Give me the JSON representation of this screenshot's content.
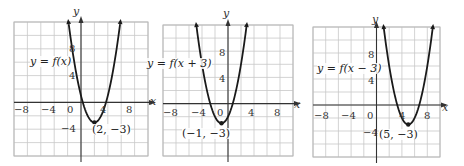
{
  "chart_data": [
    {
      "type": "line",
      "title": "",
      "function_label": "y = f(x)",
      "equation": "y = (x - 2)^2 - 3",
      "vertex": [
        2,
        -3
      ],
      "vertex_label": "(2, −3)",
      "xlabel": "x",
      "ylabel": "y",
      "xlim": [
        -10,
        10
      ],
      "ylim": [
        -8,
        12
      ],
      "x_ticks": [
        -8,
        -4,
        0,
        4,
        8
      ],
      "y_ticks": [
        8,
        4,
        -4
      ],
      "grid": true,
      "grid_step": 2
    },
    {
      "type": "line",
      "title": "",
      "function_label": "y = f(x + 3)",
      "equation": "y = (x + 1)^2 - 3",
      "vertex": [
        -1,
        -3
      ],
      "vertex_label": "(−1, −3)",
      "xlabel": "x",
      "ylabel": "y",
      "xlim": [
        -10,
        10
      ],
      "ylim": [
        -8,
        12
      ],
      "x_ticks": [
        -8,
        -4,
        0,
        4,
        8
      ],
      "y_ticks": [
        8,
        4
      ],
      "grid": true,
      "grid_step": 2
    },
    {
      "type": "line",
      "title": "",
      "function_label": "y = f(x − 3)",
      "equation": "y = (x - 5)^2 - 3",
      "vertex": [
        5,
        -3
      ],
      "vertex_label": "(5, −3)",
      "xlabel": "x",
      "ylabel": "y",
      "xlim": [
        -10,
        10
      ],
      "ylim": [
        -8,
        12
      ],
      "x_ticks": [
        -8,
        -4,
        0,
        4,
        8
      ],
      "y_ticks": [
        8,
        4,
        -4
      ],
      "grid": true,
      "grid_step": 2
    }
  ],
  "panels": [
    {
      "function_label": "y = f(x)",
      "vertex_label": "(2, −3)",
      "x_axis": "x",
      "y_axis": "y",
      "ticks": {
        "xm8": "−8",
        "xm4": "−4",
        "x0": "0",
        "x4": "4",
        "x8": "8",
        "y8": "8",
        "y4": "4",
        "ym4": "−4"
      }
    },
    {
      "function_label": "y = f(x + 3)",
      "vertex_label": "(−1, −3)",
      "x_axis": "x",
      "y_axis": "y",
      "ticks": {
        "xm8": "−8",
        "xm4": "−4",
        "x0": "0",
        "x4": "4",
        "x8": "8",
        "y8": "8",
        "y4": "4"
      }
    },
    {
      "function_label": "y = f(x − 3)",
      "vertex_label": "(5, −3)",
      "x_axis": "x",
      "y_axis": "y",
      "ticks": {
        "xm8": "−8",
        "xm4": "−4",
        "x0": "0",
        "x4": "4",
        "x8": "8",
        "y8": "8",
        "y4": "4",
        "ym4": "−4"
      }
    }
  ],
  "colors": {
    "grid": "#c8c8c8",
    "axis": "#333333",
    "curve": "#1a1a1a",
    "frame": "#b8b8b8"
  }
}
